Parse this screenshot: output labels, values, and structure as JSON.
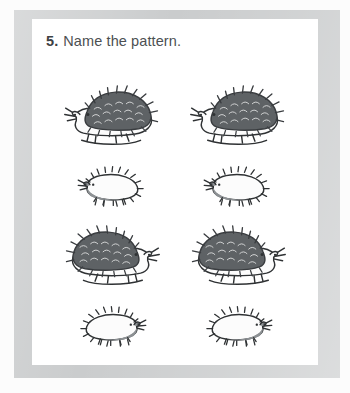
{
  "page": {
    "background_color": "#fcfcfc",
    "border_color": "#c9cbcc",
    "paper_color": "#ffffff"
  },
  "question": {
    "number": "5.",
    "text": "Name the pattern."
  },
  "pattern": {
    "description": "A repeating picture pattern of hedgehogs",
    "rows": [
      {
        "row_index": 1,
        "size": "large",
        "items": [
          {
            "size": "large",
            "facing": "left",
            "label": "big hedgehog facing left"
          },
          {
            "size": "large",
            "facing": "left",
            "label": "big hedgehog facing left"
          }
        ]
      },
      {
        "row_index": 2,
        "size": "small",
        "items": [
          {
            "size": "small",
            "facing": "left",
            "label": "small hedgehog facing left"
          },
          {
            "size": "small",
            "facing": "left",
            "label": "small hedgehog facing left"
          }
        ]
      },
      {
        "row_index": 3,
        "size": "large",
        "items": [
          {
            "size": "large",
            "facing": "right",
            "label": "big hedgehog facing right"
          },
          {
            "size": "large",
            "facing": "right",
            "label": "big hedgehog facing right"
          }
        ]
      },
      {
        "row_index": 4,
        "size": "small",
        "items": [
          {
            "size": "small",
            "facing": "right",
            "label": "small hedgehog facing right"
          },
          {
            "size": "small",
            "facing": "right",
            "label": "small hedgehog facing right"
          }
        ]
      }
    ],
    "colors": {
      "quill_fill": "#5e6265",
      "quill_outline": "#3a3d40",
      "body_fill": "#fbfbfb",
      "face_fill": "#8d9194",
      "ink": "#2f3234"
    }
  }
}
